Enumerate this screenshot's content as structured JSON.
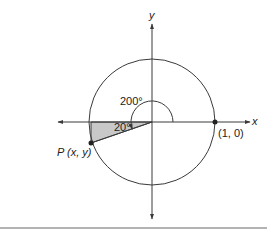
{
  "diagram": {
    "axes": {
      "x_label": "x",
      "y_label": "y"
    },
    "circle": {
      "type": "unit-circle",
      "center": [
        0,
        0
      ],
      "radius": 1
    },
    "points": {
      "unit_point_label": "(1, 0)",
      "p_label": "P (x, y)"
    },
    "angles": {
      "big_angle_label": "200°",
      "ref_angle_label": "20°"
    },
    "colors": {
      "stroke": "#3a3a3a",
      "shade": "#c8c8c8"
    }
  }
}
